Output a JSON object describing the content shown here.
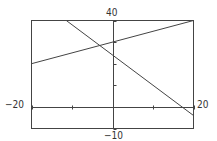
{
  "chart_data": {
    "type": "line",
    "title": "",
    "xlabel": "",
    "ylabel": "",
    "xlim": [
      -20,
      20
    ],
    "ylim": [
      -10,
      40
    ],
    "x_tick_step": 10,
    "y_tick_step": 10,
    "grid": false,
    "legend": null,
    "window_labels": {
      "xmin": "−20",
      "xmax": "20",
      "ymin": "−10",
      "ymax": "40"
    },
    "series": [
      {
        "name": "line-rising",
        "equation": "y = 0.5x + 30",
        "x": [
          -20,
          20
        ],
        "y": [
          20,
          40
        ]
      },
      {
        "name": "line-falling",
        "equation": "y = -1.4x + 24",
        "x": [
          -11.4,
          20
        ],
        "y": [
          40,
          -4
        ]
      }
    ]
  }
}
